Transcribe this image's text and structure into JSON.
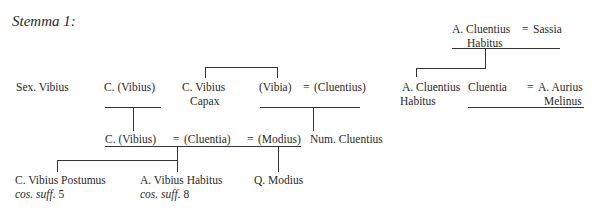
{
  "title": "Stemma 1:",
  "persons": {
    "a_cluentius_habitus_sr": {
      "line1": "A. Cluentius",
      "line2": "Habitus"
    },
    "sassia": {
      "line1": "Sassia"
    },
    "sex_vibius": {
      "line1": "Sex. Vibius"
    },
    "c_vibius_1": {
      "line1": "C. (Vibius)"
    },
    "c_vibius_capax": {
      "line1": "C. Vibius",
      "line2": "Capax"
    },
    "vibia": {
      "line1": "(Vibia)"
    },
    "cluentius_paren": {
      "line1": "(Cluentius)"
    },
    "a_cluentius_habitus_jr": {
      "line1": "A. Cluentius",
      "line2": "Habitus"
    },
    "cluentia": {
      "line1": "Cluentia"
    },
    "a_aurius_melinus": {
      "line1": "A. Aurius",
      "line2": "Melinus"
    },
    "c_vibius_2": {
      "line1": "C. (Vibius)"
    },
    "cluentia_paren": {
      "line1": "(Cluentia)"
    },
    "modius_paren": {
      "line1": "(Modius)"
    },
    "num_cluentius": {
      "line1": "Num. Cluentius"
    },
    "c_vibius_postumus": {
      "line1": "C. Vibius Postumus",
      "note": "cos. suff.",
      "note_num": "5"
    },
    "a_vibius_habitus": {
      "line1": "A. Vibius Habitus",
      "note": "cos. suff.",
      "note_num": "8"
    },
    "q_modius": {
      "line1": "Q. Modius"
    }
  },
  "marriage_sign": "="
}
